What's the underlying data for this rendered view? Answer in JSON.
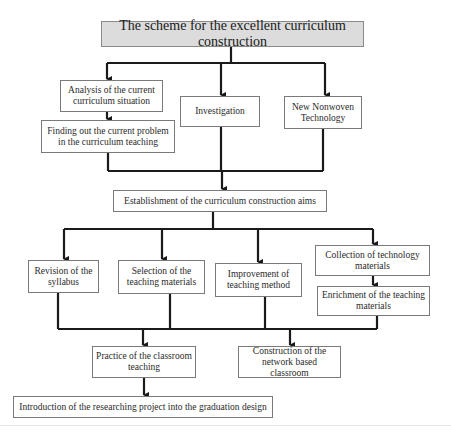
{
  "diagram": {
    "type": "flowchart",
    "title": "The scheme for the excellent curriculum construction",
    "nodes": {
      "analysis": "Analysis of the current curriculum situation",
      "finding": "Finding out the current problem in the curriculum teaching",
      "investigation": "Investigation",
      "nonwoven": "New Nonwoven Technology",
      "aims": "Establishment of the curriculum construction aims",
      "revision": "Revision of the syllabus",
      "selection": "Selection of the teaching materials",
      "improvement": "Improvement of teaching method",
      "collection": "Collection of technology materials",
      "enrichment": "Enrichment of the teaching materials",
      "practice": "Practice of the classroom teaching",
      "construction": "Construction of the network based classroom",
      "introduction": "Introduction of the researching project into the graduation design"
    },
    "edges": [
      [
        "title",
        "analysis"
      ],
      [
        "title",
        "investigation"
      ],
      [
        "title",
        "nonwoven"
      ],
      [
        "analysis",
        "finding"
      ],
      [
        "finding",
        "aims"
      ],
      [
        "investigation",
        "aims"
      ],
      [
        "nonwoven",
        "aims"
      ],
      [
        "aims",
        "revision"
      ],
      [
        "aims",
        "selection"
      ],
      [
        "aims",
        "improvement"
      ],
      [
        "aims",
        "collection"
      ],
      [
        "collection",
        "enrichment"
      ],
      [
        "revision",
        "practice"
      ],
      [
        "selection",
        "practice"
      ],
      [
        "improvement",
        "practice"
      ],
      [
        "enrichment",
        "practice"
      ],
      [
        "revision",
        "construction"
      ],
      [
        "selection",
        "construction"
      ],
      [
        "improvement",
        "construction"
      ],
      [
        "enrichment",
        "construction"
      ],
      [
        "practice",
        "introduction"
      ]
    ],
    "colors": {
      "title_fill": "#dcdcdc",
      "box_border": "#7a7a7a",
      "connector": "#1a1a1a"
    }
  }
}
